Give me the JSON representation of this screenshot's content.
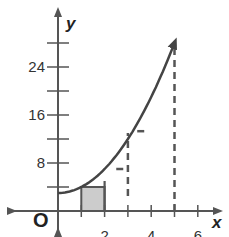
{
  "chart_data": {
    "type": "line",
    "title": "",
    "xlabel": "x",
    "ylabel": "y",
    "origin_label": "O",
    "xlim": [
      -1.5,
      7
    ],
    "ylim": [
      -3,
      31
    ],
    "x_ticks": [
      1,
      2,
      3,
      4,
      5,
      6
    ],
    "x_tick_labels": [
      {
        "value": 2,
        "label": "2"
      },
      {
        "value": 4,
        "label": "4"
      },
      {
        "value": 6,
        "label": "6"
      }
    ],
    "y_ticks": [
      4,
      8,
      12,
      16,
      20,
      24,
      28
    ],
    "y_tick_labels": [
      {
        "value": 8,
        "label": "8"
      },
      {
        "value": 16,
        "label": "16"
      },
      {
        "value": 24,
        "label": "24"
      }
    ],
    "grid": false,
    "series": [
      {
        "name": "curve",
        "x": [
          0,
          1,
          2,
          3,
          4,
          5
        ],
        "y": [
          3,
          4,
          7,
          12,
          19,
          28
        ],
        "arrow_end": true
      }
    ],
    "shaded_rectangles": [
      {
        "x_from": 1,
        "x_to": 2,
        "height": 4,
        "fill": "#cccccc"
      }
    ],
    "solid_segments": [
      {
        "x": 2,
        "y_from": 0,
        "y_to": 5
      }
    ],
    "dashed_segments": [
      {
        "x": 3,
        "y_from": 2.5,
        "y_to": 13
      },
      {
        "x": 5,
        "y_from": 0,
        "y_to": 28
      },
      {
        "y": 7,
        "x_from": 2.5,
        "x_to": 2.9,
        "orientation": "horizontal"
      },
      {
        "y": 13.3,
        "x_from": 3.4,
        "x_to": 3.8,
        "orientation": "horizontal"
      }
    ],
    "colors": {
      "axis": "#555555",
      "curve": "#444444",
      "fill": "#cccccc"
    }
  }
}
